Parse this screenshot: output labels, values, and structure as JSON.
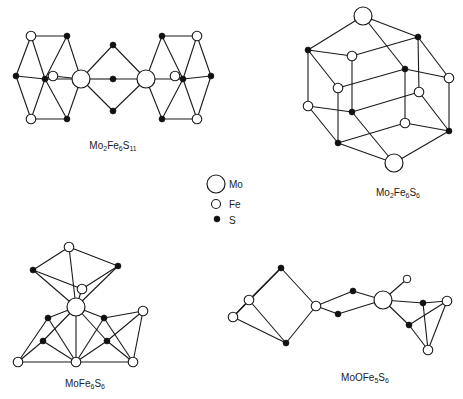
{
  "legend": {
    "items": [
      {
        "element": "Mo",
        "label": "Mo",
        "symbol": "large-open-circle",
        "x": 216,
        "y": 184,
        "r": 9
      },
      {
        "element": "Fe",
        "label": "Fe",
        "symbol": "small-open-circle",
        "x": 216,
        "y": 204,
        "r": 4.5
      },
      {
        "element": "S",
        "label": "S",
        "symbol": "filled-dot",
        "x": 217,
        "y": 219,
        "r": 3
      }
    ]
  },
  "structures": [
    {
      "id": "mo2fe6s11",
      "formula": {
        "parts": [
          [
            "Mo",
            "2"
          ],
          [
            "Fe",
            "6"
          ],
          [
            "S",
            "11"
          ]
        ]
      },
      "label_pos": [
        113,
        146
      ],
      "atoms": [
        [
          "Fe",
          31,
          36
        ],
        [
          "S",
          67,
          36
        ],
        [
          "S",
          16,
          76
        ],
        [
          "S",
          45,
          79
        ],
        [
          "Fe",
          53,
          76
        ],
        [
          "Mo",
          81,
          79
        ],
        [
          "Fe",
          31,
          119
        ],
        [
          "S",
          67,
          119
        ],
        [
          "S",
          113,
          45
        ],
        [
          "S",
          113,
          79
        ],
        [
          "S",
          113,
          111
        ],
        [
          "Mo",
          146,
          79
        ],
        [
          "Fe",
          175,
          76
        ],
        [
          "S",
          183,
          79
        ],
        [
          "S",
          211,
          76
        ],
        [
          "Fe",
          197,
          36
        ],
        [
          "S",
          162,
          36
        ],
        [
          "Fe",
          197,
          119
        ],
        [
          "S",
          162,
          119
        ]
      ],
      "bonds": [
        [
          0,
          1
        ],
        [
          0,
          2
        ],
        [
          0,
          3
        ],
        [
          1,
          3
        ],
        [
          1,
          5
        ],
        [
          2,
          3
        ],
        [
          2,
          6
        ],
        [
          3,
          6
        ],
        [
          3,
          7
        ],
        [
          6,
          7
        ],
        [
          7,
          5
        ],
        [
          3,
          5
        ],
        [
          4,
          5
        ],
        [
          5,
          8
        ],
        [
          5,
          9
        ],
        [
          5,
          10
        ],
        [
          8,
          11
        ],
        [
          9,
          11
        ],
        [
          10,
          11
        ],
        [
          11,
          13
        ],
        [
          11,
          16
        ],
        [
          11,
          18
        ],
        [
          16,
          15
        ],
        [
          16,
          13
        ],
        [
          15,
          13
        ],
        [
          15,
          14
        ],
        [
          13,
          14
        ],
        [
          14,
          17
        ],
        [
          13,
          17
        ],
        [
          18,
          17
        ],
        [
          18,
          13
        ],
        [
          12,
          13
        ]
      ]
    },
    {
      "id": "mo2fe6s6",
      "formula": {
        "parts": [
          [
            "Mo",
            "2"
          ],
          [
            "Fe",
            "6"
          ],
          [
            "S",
            "6"
          ]
        ]
      },
      "label_pos": [
        398,
        193
      ],
      "atoms": [
        [
          "Mo",
          363,
          16
        ],
        [
          "S",
          308,
          50
        ],
        [
          "S",
          418,
          37
        ],
        [
          "Fe",
          352,
          56
        ],
        [
          "S",
          405,
          69
        ],
        [
          "Fe",
          449,
          78
        ],
        [
          "Fe",
          338,
          88
        ],
        [
          "Fe",
          308,
          106
        ],
        [
          "S",
          352,
          112
        ],
        [
          "Fe",
          419,
          92
        ],
        [
          "Fe",
          405,
          123
        ],
        [
          "S",
          338,
          143
        ],
        [
          "S",
          449,
          131
        ],
        [
          "Mo",
          394,
          163
        ]
      ],
      "bonds": [
        [
          0,
          1
        ],
        [
          0,
          2
        ],
        [
          0,
          4
        ],
        [
          1,
          3
        ],
        [
          1,
          6
        ],
        [
          1,
          7
        ],
        [
          2,
          3
        ],
        [
          2,
          5
        ],
        [
          2,
          9
        ],
        [
          3,
          8
        ],
        [
          4,
          6
        ],
        [
          4,
          5
        ],
        [
          4,
          10
        ],
        [
          5,
          12
        ],
        [
          6,
          11
        ],
        [
          7,
          8
        ],
        [
          7,
          11
        ],
        [
          8,
          9
        ],
        [
          8,
          13
        ],
        [
          9,
          12
        ],
        [
          10,
          11
        ],
        [
          10,
          12
        ],
        [
          11,
          13
        ],
        [
          12,
          13
        ]
      ]
    },
    {
      "id": "mofe6s6",
      "formula": {
        "parts": [
          [
            "MoFe",
            "6"
          ],
          [
            "S",
            "6"
          ]
        ]
      },
      "label_pos": [
        85,
        384
      ],
      "atoms": [
        [
          "Fe",
          69,
          247
        ],
        [
          "S",
          33,
          270
        ],
        [
          "S",
          118,
          266
        ],
        [
          "Fe",
          82,
          289
        ],
        [
          "Mo",
          76,
          307
        ],
        [
          "S",
          48,
          318
        ],
        [
          "S",
          104,
          318
        ],
        [
          "Fe",
          143,
          311
        ],
        [
          "S",
          43,
          341
        ],
        [
          "S",
          107,
          341
        ],
        [
          "Fe",
          18,
          362
        ],
        [
          "Fe",
          76,
          362
        ],
        [
          "Fe",
          133,
          362
        ]
      ],
      "bonds": [
        [
          0,
          1
        ],
        [
          0,
          2
        ],
        [
          0,
          4
        ],
        [
          1,
          3
        ],
        [
          1,
          4
        ],
        [
          2,
          3
        ],
        [
          2,
          4
        ],
        [
          3,
          4
        ],
        [
          4,
          5
        ],
        [
          4,
          6
        ],
        [
          4,
          11
        ],
        [
          4,
          8
        ],
        [
          4,
          9
        ],
        [
          5,
          10
        ],
        [
          5,
          11
        ],
        [
          6,
          7
        ],
        [
          6,
          11
        ],
        [
          6,
          12
        ],
        [
          7,
          9
        ],
        [
          7,
          12
        ],
        [
          8,
          10
        ],
        [
          8,
          11
        ],
        [
          9,
          11
        ],
        [
          9,
          12
        ],
        [
          10,
          11
        ],
        [
          11,
          12
        ]
      ]
    },
    {
      "id": "moofe5s6",
      "formula": {
        "parts": [
          [
            "MoOFe",
            "5"
          ],
          [
            "S",
            "6"
          ]
        ]
      },
      "label_pos": [
        365,
        378
      ],
      "atoms": [
        [
          "S",
          281,
          268
        ],
        [
          "Fe",
          249,
          300
        ],
        [
          "Fe",
          233,
          317
        ],
        [
          "S",
          286,
          343
        ],
        [
          "Fe",
          316,
          306
        ],
        [
          "S",
          353,
          291
        ],
        [
          "S",
          338,
          314
        ],
        [
          "Mo",
          383,
          300
        ],
        [
          "O",
          407,
          279
        ],
        [
          "S",
          423,
          303
        ],
        [
          "Fe",
          447,
          301
        ],
        [
          "S",
          409,
          325
        ],
        [
          "Fe",
          428,
          350
        ]
      ],
      "bonds": [
        [
          0,
          1
        ],
        [
          0,
          2
        ],
        [
          0,
          4
        ],
        [
          1,
          2
        ],
        [
          1,
          3
        ],
        [
          2,
          3
        ],
        [
          3,
          4
        ],
        [
          4,
          5
        ],
        [
          4,
          6
        ],
        [
          5,
          7
        ],
        [
          6,
          7
        ],
        [
          7,
          8
        ],
        [
          7,
          9
        ],
        [
          7,
          11
        ],
        [
          9,
          10
        ],
        [
          9,
          12
        ],
        [
          10,
          11
        ],
        [
          10,
          12
        ],
        [
          11,
          12
        ]
      ]
    }
  ],
  "styles": {
    "radius": {
      "Mo": 9,
      "Fe": 4.8,
      "O": 3.8,
      "S": 3
    }
  }
}
